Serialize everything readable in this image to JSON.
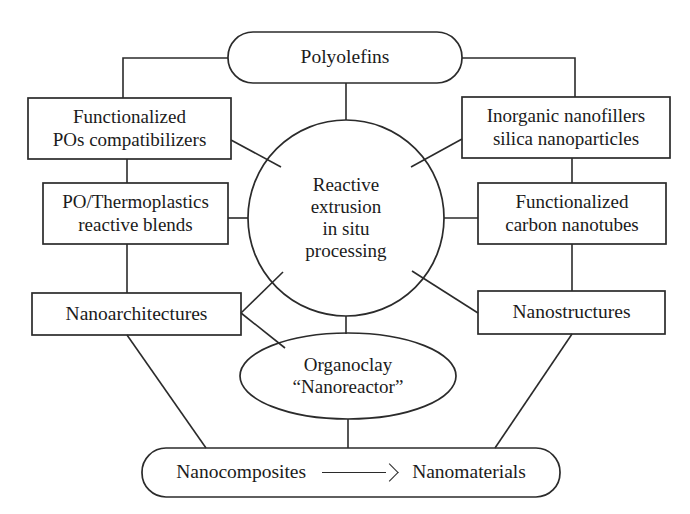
{
  "diagram": {
    "colors": {
      "stroke": "#2b2b2b",
      "background": "#ffffff",
      "text": "#1b1b1b"
    },
    "nodes": {
      "polyolefins": {
        "shape": "rounded-rectangle",
        "lines": [
          "Polyolefins"
        ]
      },
      "functionalized_pos": {
        "shape": "rectangle",
        "lines": [
          "Functionalized",
          "POs compatibilizers"
        ]
      },
      "inorganic_nanofillers": {
        "shape": "rectangle",
        "lines": [
          "Inorganic nanofillers",
          "silica nanoparticles"
        ]
      },
      "po_thermoplastics": {
        "shape": "rectangle",
        "lines": [
          "PO/Thermoplastics",
          "reactive blends"
        ]
      },
      "functionalized_cnt": {
        "shape": "rectangle",
        "lines": [
          "Functionalized",
          "carbon nanotubes"
        ]
      },
      "center_process": {
        "shape": "circle",
        "lines": [
          "Reactive",
          "extrusion",
          "in situ",
          "processing"
        ]
      },
      "nanoarchitectures": {
        "shape": "rectangle",
        "lines": [
          "Nanoarchitectures"
        ]
      },
      "nanostructures": {
        "shape": "rectangle",
        "lines": [
          "Nanostructures"
        ]
      },
      "organoclay": {
        "shape": "ellipse",
        "lines": [
          "Organoclay",
          "“Nanoreactor”"
        ]
      },
      "outcome": {
        "shape": "rounded-rectangle",
        "left_label": "Nanocomposites",
        "arrow": "→",
        "right_label": "Nanomaterials"
      }
    }
  }
}
